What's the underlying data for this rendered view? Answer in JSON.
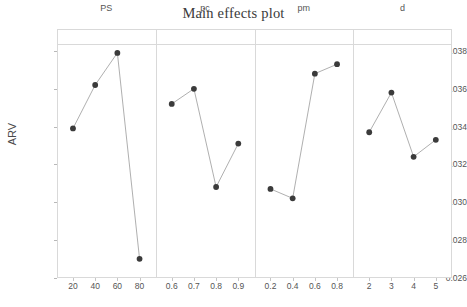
{
  "chart_data": {
    "type": "line",
    "title": "Main effects plot",
    "xlabel": "",
    "ylabel": "ARV",
    "ylim": [
      0.026,
      0.038
    ],
    "yticks": [
      0.026,
      0.028,
      0.03,
      0.032,
      0.034,
      0.036,
      0.038
    ],
    "ytick_labels": [
      "0.026",
      "0.028",
      "0.030",
      "0.032",
      "0.034",
      "0.036",
      "0.038"
    ],
    "grid": true,
    "legend": "none",
    "panels": [
      {
        "name": "PS",
        "categories": [
          "20",
          "40",
          "60",
          "80"
        ],
        "values": [
          0.0339,
          0.0362,
          0.0379,
          0.027
        ]
      },
      {
        "name": "pc",
        "categories": [
          "0.6",
          "0.7",
          "0.8",
          "0.9"
        ],
        "values": [
          0.0352,
          0.036,
          0.0308,
          0.0331
        ]
      },
      {
        "name": "pm",
        "categories": [
          "0.2",
          "0.4",
          "0.6",
          "0.8"
        ],
        "values": [
          0.0307,
          0.0302,
          0.0368,
          0.0373
        ]
      },
      {
        "name": "d",
        "categories": [
          "2",
          "3",
          "4",
          "5"
        ],
        "values": [
          0.0337,
          0.0358,
          0.0324,
          0.0333
        ]
      }
    ],
    "marker_color": "#3b3b3b",
    "line_color": "#9a9a9a",
    "axis_color": "#d9d9d9",
    "grid_color": "#f2f0f0",
    "text_color": "#555555"
  }
}
